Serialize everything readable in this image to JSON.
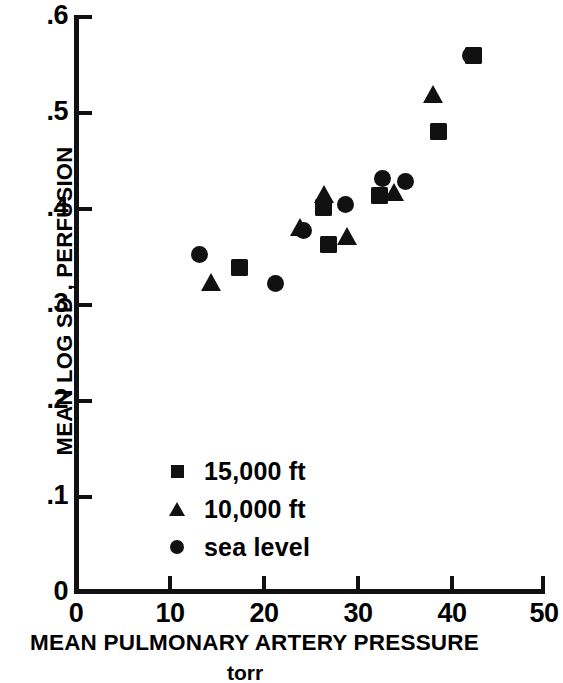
{
  "chart_data": {
    "type": "scatter",
    "title": "",
    "xlabel": "MEAN PULMONARY ARTERY PRESSURE",
    "xunit": "torr",
    "ylabel": "MEAN LOG SD , PERFUSION",
    "xlim": [
      0,
      50
    ],
    "ylim": [
      0,
      0.6
    ],
    "xticks": [
      "0",
      "10",
      "20",
      "30",
      "40",
      "50"
    ],
    "xtick_values": [
      0,
      10,
      20,
      30,
      40,
      50
    ],
    "yticks": [
      "0",
      ".1",
      ".2",
      ".3",
      ".4",
      ".5",
      ".6"
    ],
    "ytick_values": [
      0,
      0.1,
      0.2,
      0.3,
      0.4,
      0.5,
      0.6
    ],
    "grid": false,
    "legend_position": "lower-center-left",
    "series": [
      {
        "name": "15,000 ft",
        "marker": "square",
        "color": "#111111",
        "points": [
          {
            "x": 17.5,
            "y": 0.338
          },
          {
            "x": 26.5,
            "y": 0.401
          },
          {
            "x": 27.0,
            "y": 0.362
          },
          {
            "x": 32.5,
            "y": 0.413
          },
          {
            "x": 38.8,
            "y": 0.48
          },
          {
            "x": 42.6,
            "y": 0.56
          }
        ]
      },
      {
        "name": "10,000 ft",
        "marker": "triangle",
        "color": "#111111",
        "points": [
          {
            "x": 14.5,
            "y": 0.322
          },
          {
            "x": 24.0,
            "y": 0.379
          },
          {
            "x": 26.5,
            "y": 0.414
          },
          {
            "x": 29.0,
            "y": 0.37
          },
          {
            "x": 34.0,
            "y": 0.416
          },
          {
            "x": 38.2,
            "y": 0.518
          }
        ]
      },
      {
        "name": "sea level",
        "marker": "circle",
        "color": "#111111",
        "points": [
          {
            "x": 13.2,
            "y": 0.352
          },
          {
            "x": 21.4,
            "y": 0.321
          },
          {
            "x": 24.3,
            "y": 0.377
          },
          {
            "x": 28.9,
            "y": 0.404
          },
          {
            "x": 32.8,
            "y": 0.431
          },
          {
            "x": 35.3,
            "y": 0.428
          },
          {
            "x": 42.2,
            "y": 0.56
          }
        ]
      }
    ],
    "legend": [
      {
        "label": "15,000 ft",
        "marker": "square"
      },
      {
        "label": "10,000 ft",
        "marker": "triangle"
      },
      {
        "label": "sea level",
        "marker": "circle"
      }
    ]
  }
}
